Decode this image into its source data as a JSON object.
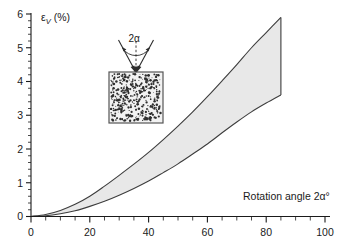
{
  "chart_data": {
    "type": "area",
    "title": "",
    "subtitle": "",
    "xlabel": "Rotation angle 2α°",
    "ylabel": "ε",
    "ylabel_sub": "V",
    "ylabel_units": "(%)",
    "xlim": [
      0,
      100
    ],
    "ylim": [
      0,
      6
    ],
    "grid": false,
    "legend": null,
    "x_major_ticks": [
      0,
      20,
      40,
      60,
      80,
      100
    ],
    "x_major_labels": [
      "0",
      "20",
      "40",
      "60",
      "80",
      "100"
    ],
    "x_minor_step": 5,
    "y_major_ticks": [
      0,
      1,
      2,
      3,
      4,
      5,
      6
    ],
    "y_major_labels": [
      "0",
      "1",
      "2",
      "3",
      "4",
      "5",
      "6"
    ],
    "y_minor_step": 0.2,
    "band_fill_color": "#e8e8e8",
    "curve_color": "#3d3d3d",
    "x": [
      0,
      5,
      10,
      15,
      20,
      25,
      30,
      35,
      40,
      45,
      50,
      55,
      60,
      65,
      70,
      75,
      80,
      85
    ],
    "series": [
      {
        "name": "upper bound",
        "values": [
          0.0,
          0.06,
          0.18,
          0.36,
          0.6,
          0.9,
          1.22,
          1.55,
          1.9,
          2.28,
          2.68,
          3.1,
          3.55,
          4.02,
          4.5,
          5.0,
          5.45,
          5.9
        ]
      },
      {
        "name": "lower bound",
        "values": [
          0.0,
          0.02,
          0.08,
          0.17,
          0.3,
          0.45,
          0.63,
          0.83,
          1.05,
          1.3,
          1.56,
          1.85,
          2.15,
          2.48,
          2.8,
          3.1,
          3.36,
          3.6
        ]
      }
    ],
    "band_end_x": 85,
    "annotations": []
  },
  "inset": {
    "name": "cone-indenter-diagram",
    "angle_label": "2α",
    "specimen_label": "",
    "description": "granular specimen block with converging indenter arrows"
  }
}
